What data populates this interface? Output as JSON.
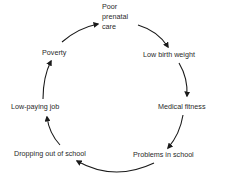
{
  "diagram": {
    "type": "cycle",
    "nodes": [
      {
        "id": "poor_prenatal_care",
        "line1": "Poor",
        "line2": "prenatal",
        "line3": "care"
      },
      {
        "id": "low_birth_weight",
        "label": "Low birth weight"
      },
      {
        "id": "medical_fitness",
        "label": "Medical fitness"
      },
      {
        "id": "problems_in_school",
        "label": "Problems in school"
      },
      {
        "id": "dropping_out",
        "label": "Dropping out of school"
      },
      {
        "id": "low_paying_job",
        "label": "Low-paying job"
      },
      {
        "id": "poverty",
        "label": "Poverty"
      }
    ],
    "edges": [
      {
        "from": "poverty",
        "to": "poor_prenatal_care"
      },
      {
        "from": "poor_prenatal_care",
        "to": "low_birth_weight"
      },
      {
        "from": "low_birth_weight",
        "to": "medical_fitness"
      },
      {
        "from": "medical_fitness",
        "to": "problems_in_school"
      },
      {
        "from": "problems_in_school",
        "to": "dropping_out"
      },
      {
        "from": "dropping_out",
        "to": "low_paying_job"
      },
      {
        "from": "low_paying_job",
        "to": "poverty"
      }
    ],
    "colors": {
      "text": "#2a2a2a",
      "arrow": "#1a1a1a",
      "background": "#ffffff"
    }
  }
}
